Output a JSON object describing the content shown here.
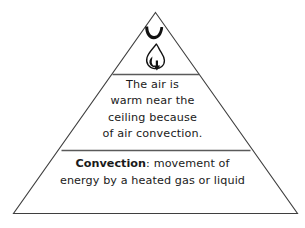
{
  "figure": {
    "type": "pyramid-diagram",
    "background_color": "#ffffff",
    "outline_color": "#3f3f3f",
    "divider_color": "#5a5a5a",
    "text_color": "#1a1a1a",
    "apex_icon": "flame-icon"
  },
  "tiers": {
    "top": {
      "icon_name": "flame-icon",
      "icon_description": "candle flame with arc above and downward arrow"
    },
    "middle": {
      "lines": [
        "The air is",
        "warm near the",
        "ceiling because",
        "of air convection."
      ]
    },
    "bottom": {
      "term": "Convection",
      "separator": ":",
      "line1_rest": " movement of",
      "line2": "energy by a heated gas or liquid"
    }
  }
}
